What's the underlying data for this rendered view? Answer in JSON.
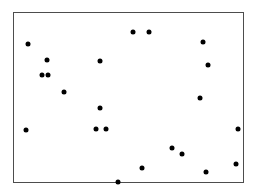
{
  "chart_data": {
    "type": "scatter",
    "title": "",
    "subtitle": "",
    "xlabel": "",
    "ylabel": "",
    "legend": [],
    "legend_position": "none",
    "grid": false,
    "axis_ticks": false,
    "tick_labels_x": [],
    "tick_labels_y": [],
    "annotations": [],
    "xlim": [
      0,
      230
    ],
    "ylim": [
      0,
      170
    ],
    "series": [
      {
        "name": "points",
        "marker": "circle",
        "marker_color": "#000000",
        "marker_size_px": 5,
        "x": [
          15,
          34,
          29,
          35,
          51,
          87,
          120,
          136,
          190,
          195,
          87,
          83,
          187,
          13,
          93,
          13,
          225,
          159,
          169,
          193,
          105,
          223
        ],
        "y": [
          32,
          48,
          63,
          63,
          80,
          49,
          20,
          20,
          30,
          53,
          96,
          117,
          86,
          118,
          117,
          118,
          117,
          136,
          142,
          160,
          170,
          152
        ]
      }
    ],
    "points": [
      {
        "x": 28,
        "y": 44
      },
      {
        "x": 47,
        "y": 60
      },
      {
        "x": 42,
        "y": 75
      },
      {
        "x": 48,
        "y": 75
      },
      {
        "x": 64,
        "y": 92
      },
      {
        "x": 100,
        "y": 61
      },
      {
        "x": 133,
        "y": 32
      },
      {
        "x": 149,
        "y": 32
      },
      {
        "x": 203,
        "y": 42
      },
      {
        "x": 208,
        "y": 65
      },
      {
        "x": 100,
        "y": 108
      },
      {
        "x": 96,
        "y": 129
      },
      {
        "x": 200,
        "y": 98
      },
      {
        "x": 26,
        "y": 130
      },
      {
        "x": 106,
        "y": 129
      },
      {
        "x": 238,
        "y": 129
      },
      {
        "x": 172,
        "y": 148
      },
      {
        "x": 182,
        "y": 154
      },
      {
        "x": 236,
        "y": 164
      },
      {
        "x": 206,
        "y": 172
      },
      {
        "x": 142,
        "y": 168
      },
      {
        "x": 118,
        "y": 182
      }
    ]
  },
  "figure": {
    "frame": {
      "left": 13,
      "top": 12,
      "width": 231,
      "height": 171
    },
    "frame_border_color": "#4d4d4d",
    "frame_border_width_px": 1,
    "background_color": "#ffffff",
    "point_color": "#000000",
    "point_diameter_px": 5,
    "point_count": 22
  }
}
